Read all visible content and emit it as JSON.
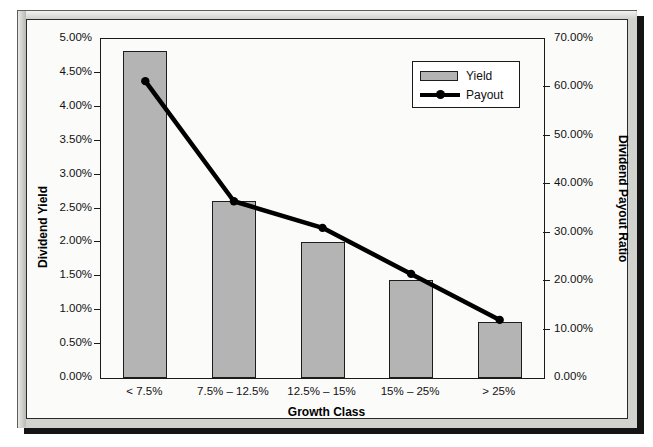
{
  "chart_data": {
    "type": "bar",
    "title": "",
    "xlabel": "Growth Class",
    "ylabel": "Dividend Yield",
    "y2label": "Dividend Payout Ratio",
    "categories": [
      "< 7.5%",
      "7.5% – 12.5%",
      "12.5% – 15%",
      "15% – 25%",
      "> 25%"
    ],
    "grid": false,
    "legend_position": "top-right",
    "series": [
      {
        "name": "Yield",
        "type": "bar",
        "axis": "left",
        "color": "#b4b4b4",
        "values": [
          4.82,
          2.61,
          2.0,
          1.45,
          0.83
        ],
        "value_labels": [
          "4.82%",
          "2.61%",
          "2.00%",
          "1.45%",
          "0.83%"
        ]
      },
      {
        "name": "Payout",
        "type": "line",
        "axis": "right",
        "color": "#000000",
        "values": [
          61.3,
          36.5,
          31.0,
          21.5,
          12.0
        ],
        "value_labels": [
          "61.30%",
          "36.50%",
          "31.00%",
          "21.50%",
          "12.00%"
        ]
      }
    ],
    "yaxis_left": {
      "label": "Dividend Yield",
      "min": 0,
      "max": 5,
      "step": 0.5,
      "ticks": [
        "0.00%",
        "0.50%",
        "1.00%",
        "1.50%",
        "2.00%",
        "2.50%",
        "3.00%",
        "3.50%",
        "4.00%",
        "4.50%",
        "5.00%"
      ]
    },
    "yaxis_right": {
      "label": "Dividend Payout Ratio",
      "min": 0,
      "max": 70,
      "step": 10,
      "ticks": [
        "0.00%",
        "10.00%",
        "20.00%",
        "30.00%",
        "40.00%",
        "50.00%",
        "60.00%",
        "70.00%"
      ]
    },
    "legend": [
      {
        "label": "Yield",
        "marker": "square-swatch",
        "color": "#b4b4b4"
      },
      {
        "label": "Payout",
        "marker": "line-with-dot",
        "color": "#000000"
      }
    ]
  }
}
